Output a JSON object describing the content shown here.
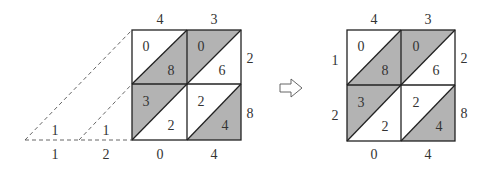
{
  "left": {
    "top_labels": [
      "4",
      "3"
    ],
    "right_labels": [
      "2",
      "8"
    ],
    "bottom_labels": [
      "0",
      "4"
    ],
    "extra_bottom": [
      "1",
      "2"
    ],
    "carry_labels": [
      "1",
      "1"
    ],
    "cells": {
      "c00": {
        "upper": "0",
        "lower": "8"
      },
      "c01": {
        "upper": "0",
        "lower": "6"
      },
      "c10": {
        "upper": "3",
        "lower": "2"
      },
      "c11": {
        "upper": "2",
        "lower": "4"
      }
    }
  },
  "arrow": {
    "symbol": "⇨"
  },
  "right": {
    "top_labels": [
      "4",
      "3"
    ],
    "left_labels": [
      "1",
      "2"
    ],
    "right_labels": [
      "2",
      "8"
    ],
    "bottom_labels": [
      "0",
      "4"
    ],
    "cells": {
      "c00": {
        "upper": "0",
        "lower": "8"
      },
      "c01": {
        "upper": "0",
        "lower": "6"
      },
      "c10": {
        "upper": "3",
        "lower": "2"
      },
      "c11": {
        "upper": "2",
        "lower": "4"
      }
    }
  },
  "colors": {
    "shade": "#b3b3b3",
    "line": "#222222",
    "text": "#333333"
  }
}
